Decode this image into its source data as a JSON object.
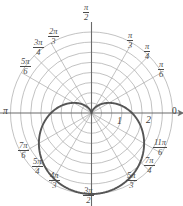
{
  "chart_data": {
    "type": "line",
    "plot_kind": "polar",
    "title": "",
    "xlabel": "",
    "ylabel": "",
    "curve_name": "cardioid",
    "equation": "r = 1 - sin(theta)",
    "rlim": [
      0,
      2
    ],
    "grid": true,
    "grid_circles": [
      0.25,
      0.5,
      0.75,
      1.0,
      1.25,
      1.5,
      1.75,
      2.0
    ],
    "radial_tick_labels": [
      "1",
      "2"
    ],
    "radial_tick_values": [
      1,
      2
    ],
    "angle_spokes_deg": [
      0,
      30,
      45,
      60,
      90,
      120,
      135,
      150,
      180,
      210,
      225,
      240,
      270,
      300,
      315,
      330
    ],
    "angle_labels": [
      {
        "name": "zero",
        "deg": 0,
        "numerator": "",
        "denominator": "",
        "plain": "0"
      },
      {
        "name": "pi-over-6",
        "deg": 30,
        "numerator": "π",
        "denominator": "6",
        "plain": ""
      },
      {
        "name": "pi-over-4",
        "deg": 45,
        "numerator": "π",
        "denominator": "4",
        "plain": ""
      },
      {
        "name": "pi-over-3",
        "deg": 60,
        "numerator": "π",
        "denominator": "3",
        "plain": ""
      },
      {
        "name": "pi-over-2",
        "deg": 90,
        "numerator": "π",
        "denominator": "2",
        "plain": ""
      },
      {
        "name": "two-pi-over-3",
        "deg": 120,
        "numerator": "2π",
        "denominator": "3",
        "plain": ""
      },
      {
        "name": "three-pi-over-4",
        "deg": 135,
        "numerator": "3π",
        "denominator": "4",
        "plain": ""
      },
      {
        "name": "five-pi-over-6",
        "deg": 150,
        "numerator": "5π",
        "denominator": "6",
        "plain": ""
      },
      {
        "name": "pi",
        "deg": 180,
        "numerator": "",
        "denominator": "",
        "plain": "π"
      },
      {
        "name": "seven-pi-over-6",
        "deg": 210,
        "numerator": "7π",
        "denominator": "6",
        "plain": ""
      },
      {
        "name": "five-pi-over-4",
        "deg": 225,
        "numerator": "5π",
        "denominator": "4",
        "plain": ""
      },
      {
        "name": "four-pi-over-3",
        "deg": 240,
        "numerator": "4π",
        "denominator": "3",
        "plain": ""
      },
      {
        "name": "three-pi-over-2",
        "deg": 270,
        "numerator": "3π",
        "denominator": "2",
        "plain": ""
      },
      {
        "name": "five-pi-over-3",
        "deg": 300,
        "numerator": "5π",
        "denominator": "3",
        "plain": ""
      },
      {
        "name": "seven-pi-over-4",
        "deg": 315,
        "numerator": "7π",
        "denominator": "4",
        "plain": ""
      },
      {
        "name": "eleven-pi-over-6",
        "deg": 330,
        "numerator": "11π",
        "denominator": "6",
        "plain": ""
      }
    ],
    "theta_deg": [
      0,
      15,
      30,
      45,
      60,
      75,
      90,
      105,
      120,
      135,
      150,
      165,
      180,
      195,
      210,
      225,
      240,
      255,
      270,
      285,
      300,
      315,
      330,
      345,
      360
    ],
    "r_values": [
      1.0,
      0.741,
      0.5,
      0.293,
      0.134,
      0.034,
      0.0,
      0.034,
      0.134,
      0.293,
      0.5,
      0.741,
      1.0,
      1.259,
      1.5,
      1.707,
      1.866,
      1.966,
      2.0,
      1.966,
      1.866,
      1.707,
      1.5,
      1.259,
      1.0
    ],
    "colors": {
      "curve": "#555555",
      "grid": "#a8a8a8",
      "axis": "#6b6b6b",
      "label": "#4a4a4a",
      "background": "#ffffff"
    }
  },
  "labels": {
    "pi_over_2": {
      "num": "π",
      "den": "2"
    },
    "pi_over_3": {
      "num": "π",
      "den": "3"
    },
    "pi_over_4": {
      "num": "π",
      "den": "4"
    },
    "pi_over_6": {
      "num": "π",
      "den": "6"
    },
    "two_pi_over_3": {
      "num": "2π",
      "den": "3"
    },
    "three_pi_over_4": {
      "num": "3π",
      "den": "4"
    },
    "five_pi_over_6": {
      "num": "5π",
      "den": "6"
    },
    "pi": "π",
    "zero": "0",
    "seven_pi_over_6": {
      "num": "7π",
      "den": "6"
    },
    "five_pi_over_4": {
      "num": "5π",
      "den": "4"
    },
    "four_pi_over_3": {
      "num": "4π",
      "den": "3"
    },
    "three_pi_over_2": {
      "num": "3π",
      "den": "2"
    },
    "five_pi_over_3": {
      "num": "5π",
      "den": "3"
    },
    "seven_pi_over_4": {
      "num": "7π",
      "den": "4"
    },
    "eleven_pi_over_6": {
      "num": "11π",
      "den": "6"
    },
    "r_one": "1",
    "r_two": "2"
  }
}
